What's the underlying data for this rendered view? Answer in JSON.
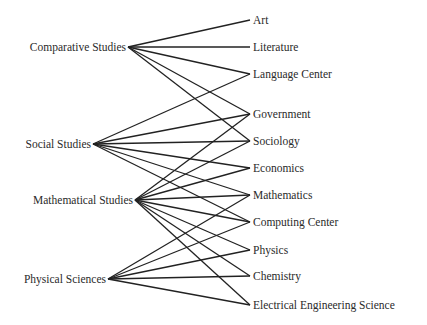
{
  "diagram": {
    "type": "bipartite-network",
    "left_nodes": [
      {
        "id": "comparative",
        "label": "Comparative Studies"
      },
      {
        "id": "social",
        "label": "Social Studies"
      },
      {
        "id": "mathematical",
        "label": "Mathematical Studies"
      },
      {
        "id": "physical",
        "label": "Physical Sciences"
      }
    ],
    "right_nodes": [
      {
        "id": "art",
        "label": "Art"
      },
      {
        "id": "literature",
        "label": "Literature"
      },
      {
        "id": "language",
        "label": "Language Center"
      },
      {
        "id": "government",
        "label": "Government"
      },
      {
        "id": "sociology",
        "label": "Sociology"
      },
      {
        "id": "economics",
        "label": "Economics"
      },
      {
        "id": "mathematics",
        "label": "Mathematics"
      },
      {
        "id": "computing",
        "label": "Computing Center"
      },
      {
        "id": "physics",
        "label": "Physics"
      },
      {
        "id": "chemistry",
        "label": "Chemistry"
      },
      {
        "id": "ees",
        "label": "Electrical Engineering Science"
      }
    ],
    "edges": [
      [
        "comparative",
        "art"
      ],
      [
        "comparative",
        "literature"
      ],
      [
        "comparative",
        "language"
      ],
      [
        "comparative",
        "government"
      ],
      [
        "comparative",
        "sociology"
      ],
      [
        "social",
        "language"
      ],
      [
        "social",
        "government"
      ],
      [
        "social",
        "sociology"
      ],
      [
        "social",
        "economics"
      ],
      [
        "social",
        "mathematics"
      ],
      [
        "social",
        "computing"
      ],
      [
        "mathematical",
        "government"
      ],
      [
        "mathematical",
        "sociology"
      ],
      [
        "mathematical",
        "economics"
      ],
      [
        "mathematical",
        "mathematics"
      ],
      [
        "mathematical",
        "computing"
      ],
      [
        "mathematical",
        "physics"
      ],
      [
        "mathematical",
        "chemistry"
      ],
      [
        "mathematical",
        "ees"
      ],
      [
        "physical",
        "mathematics"
      ],
      [
        "physical",
        "computing"
      ],
      [
        "physical",
        "physics"
      ],
      [
        "physical",
        "chemistry"
      ],
      [
        "physical",
        "ees"
      ]
    ]
  }
}
